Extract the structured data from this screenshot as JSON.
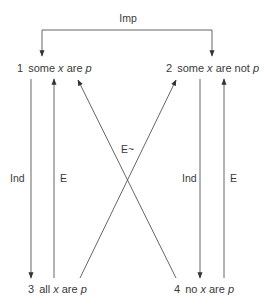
{
  "diagram": {
    "top_connector": {
      "label": "Imp"
    },
    "nodes": [
      {
        "id": 1,
        "number": "1",
        "parts": [
          "some ",
          "x",
          " are ",
          "p"
        ],
        "italic": [
          false,
          true,
          false,
          true
        ]
      },
      {
        "id": 2,
        "number": "2",
        "parts": [
          "some ",
          "x",
          " are not ",
          "p"
        ],
        "italic": [
          false,
          true,
          false,
          true
        ]
      },
      {
        "id": 3,
        "number": "3",
        "parts": [
          "all ",
          "x",
          " are ",
          "p"
        ],
        "italic": [
          false,
          true,
          false,
          true
        ]
      },
      {
        "id": 4,
        "number": "4",
        "parts": [
          "no ",
          "x",
          " are ",
          "p"
        ],
        "italic": [
          false,
          true,
          false,
          true
        ]
      }
    ],
    "edges": [
      {
        "from": "Imp",
        "to": 1,
        "label": "Imp"
      },
      {
        "from": "Imp",
        "to": 2,
        "label": "Imp"
      },
      {
        "from": 1,
        "to": 3,
        "label": "Ind"
      },
      {
        "from": 3,
        "to": 1,
        "label": "E"
      },
      {
        "from": 2,
        "to": 4,
        "label": "Ind"
      },
      {
        "from": 4,
        "to": 2,
        "label": "E"
      },
      {
        "from": 3,
        "to": 2,
        "label": "E~"
      },
      {
        "from": 4,
        "to": 1,
        "label": "E~"
      }
    ],
    "edge_labels": {
      "left_ind": "Ind",
      "left_e": "E",
      "right_ind": "Ind",
      "right_e": "E",
      "cross": "E~"
    },
    "colors": {
      "line": "#555555",
      "text": "#3a3a3a",
      "background": "#ffffff"
    }
  }
}
